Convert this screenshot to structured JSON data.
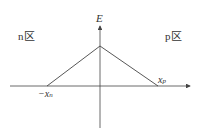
{
  "diagram": {
    "axis_y_label": "E",
    "region_n_label": "n区",
    "region_p_label": "p区",
    "x_neg_label_prefix": "−x",
    "x_neg_label_sub": "n",
    "x_pos_label": "x",
    "x_pos_label_sub": "p",
    "line_color": "#444444"
  }
}
